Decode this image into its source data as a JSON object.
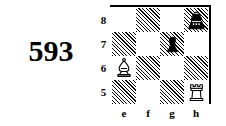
{
  "puzzle": {
    "number": "593"
  },
  "board": {
    "files": [
      "e",
      "f",
      "g",
      "h"
    ],
    "ranks": [
      "8",
      "7",
      "6",
      "5"
    ],
    "light_color": "#ffffff",
    "dark_color": "#000000",
    "border_color": "#000000",
    "squares": [
      [
        {
          "square": "e8",
          "shade": "light",
          "piece": null
        },
        {
          "square": "f8",
          "shade": "dark",
          "piece": null
        },
        {
          "square": "g8",
          "shade": "light",
          "piece": null
        },
        {
          "square": "h8",
          "shade": "dark",
          "piece": "black-king"
        }
      ],
      [
        {
          "square": "e7",
          "shade": "dark",
          "piece": null
        },
        {
          "square": "f7",
          "shade": "light",
          "piece": null
        },
        {
          "square": "g7",
          "shade": "dark",
          "piece": "black-pawn"
        },
        {
          "square": "h7",
          "shade": "light",
          "piece": null
        }
      ],
      [
        {
          "square": "e6",
          "shade": "light",
          "piece": "white-bishop"
        },
        {
          "square": "f6",
          "shade": "dark",
          "piece": null
        },
        {
          "square": "g6",
          "shade": "light",
          "piece": null
        },
        {
          "square": "h6",
          "shade": "dark",
          "piece": null
        }
      ],
      [
        {
          "square": "e5",
          "shade": "dark",
          "piece": null
        },
        {
          "square": "f5",
          "shade": "light",
          "piece": null
        },
        {
          "square": "g5",
          "shade": "dark",
          "piece": null
        },
        {
          "square": "h5",
          "shade": "light",
          "piece": "white-rook"
        }
      ]
    ],
    "pieces": [
      {
        "piece": "black-king",
        "square": "h8",
        "color": "black",
        "type": "king"
      },
      {
        "piece": "black-pawn",
        "square": "g7",
        "color": "black",
        "type": "pawn"
      },
      {
        "piece": "white-bishop",
        "square": "e6",
        "color": "white",
        "type": "bishop"
      },
      {
        "piece": "white-rook",
        "square": "h5",
        "color": "white",
        "type": "rook"
      }
    ]
  }
}
